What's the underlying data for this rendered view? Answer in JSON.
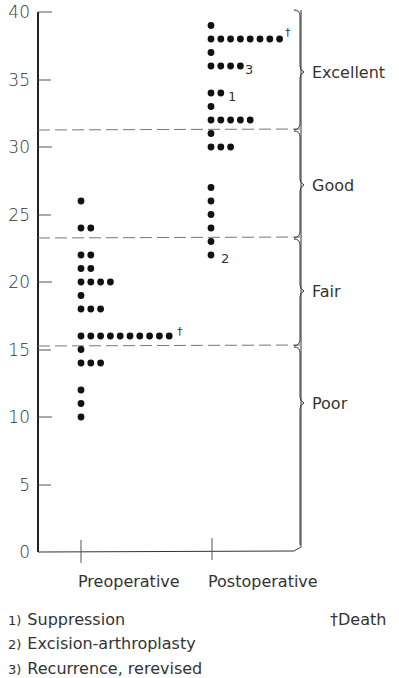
{
  "chart_data": {
    "type": "scatter",
    "subtype": "dot-plot",
    "title": "",
    "xlabel": "",
    "ylabel": "",
    "ylim": [
      0,
      40
    ],
    "yticks": [
      0,
      5,
      10,
      15,
      20,
      25,
      30,
      35,
      40
    ],
    "categories": [
      "Preoperative",
      "Postoperative"
    ],
    "grid": false,
    "series": [
      {
        "name": "Preoperative",
        "points": [
          {
            "value": 26,
            "count": 1
          },
          {
            "value": 24,
            "count": 2
          },
          {
            "value": 22,
            "count": 2
          },
          {
            "value": 21,
            "count": 2
          },
          {
            "value": 20,
            "count": 4
          },
          {
            "value": 19,
            "count": 1
          },
          {
            "value": 18,
            "count": 3
          },
          {
            "value": 16,
            "count": 10,
            "annotation": "†"
          },
          {
            "value": 15,
            "count": 1
          },
          {
            "value": 14,
            "count": 3
          },
          {
            "value": 12,
            "count": 1
          },
          {
            "value": 11,
            "count": 1
          },
          {
            "value": 10,
            "count": 1
          }
        ]
      },
      {
        "name": "Postoperative",
        "points": [
          {
            "value": 39,
            "count": 1
          },
          {
            "value": 38,
            "count": 8,
            "annotation": "†"
          },
          {
            "value": 37,
            "count": 1
          },
          {
            "value": 36,
            "count": 4,
            "annotation": "3"
          },
          {
            "value": 34,
            "count": 2,
            "annotation": "1"
          },
          {
            "value": 33,
            "count": 1
          },
          {
            "value": 32,
            "count": 5
          },
          {
            "value": 31,
            "count": 1
          },
          {
            "value": 30,
            "count": 3
          },
          {
            "value": 27,
            "count": 1
          },
          {
            "value": 26,
            "count": 1
          },
          {
            "value": 25,
            "count": 1
          },
          {
            "value": 24,
            "count": 1
          },
          {
            "value": 23,
            "count": 1
          },
          {
            "value": 22,
            "count": 1,
            "annotation": "2"
          }
        ]
      }
    ],
    "thresholds": [
      31.3,
      23.3,
      15.3
    ],
    "grades": [
      {
        "label": "Excellent",
        "from": 31.3,
        "to": 40
      },
      {
        "label": "Good",
        "from": 23.3,
        "to": 31.3
      },
      {
        "label": "Fair",
        "from": 15.3,
        "to": 23.3
      },
      {
        "label": "Poor",
        "from": 0,
        "to": 15.3
      }
    ],
    "legend": [
      {
        "marker": "1)",
        "text": "Suppression"
      },
      {
        "marker": "2)",
        "text": "Excision-arthroplasty"
      },
      {
        "marker": "3)",
        "text": "Recurrence, rerevised"
      },
      {
        "marker": "†",
        "text": "Death"
      }
    ]
  },
  "axis": {
    "ticks": [
      "0",
      "5",
      "10",
      "15",
      "20",
      "25",
      "30",
      "35",
      "40"
    ]
  },
  "labels": {
    "pre": "Preoperative",
    "post": "Postoperative",
    "excellent": "Excellent",
    "good": "Good",
    "fair": "Fair",
    "poor": "Poor",
    "note1": "1",
    "note2": "2",
    "note3": "3",
    "dagger": "†"
  },
  "legend": {
    "item1_num": "1)",
    "item1_text": "Suppression",
    "item2_num": "2)",
    "item2_text": "Excision-arthroplasty",
    "item3_num": "3)",
    "item3_text": "Recurrence, rerevised",
    "death": "†Death"
  }
}
